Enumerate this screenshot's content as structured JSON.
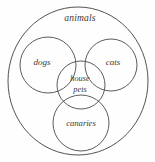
{
  "diagram": {
    "type": "euler-venn",
    "title_label": "animals",
    "background_color": "#fefefe",
    "stroke_color": "#4a4a48",
    "sets": [
      {
        "id": "animals",
        "label": "animals",
        "shape": "ellipse",
        "cx": 78,
        "cy": 81,
        "rx": 70,
        "ry": 74,
        "label_x": 80,
        "label_y": 19
      },
      {
        "id": "dogs",
        "label": "dogs",
        "shape": "circle",
        "cx": 48,
        "cy": 65,
        "r": 28,
        "label_x": 42,
        "label_y": 63
      },
      {
        "id": "cats",
        "label": "cats",
        "shape": "circle",
        "cx": 111,
        "cy": 65,
        "r": 26,
        "label_x": 113,
        "label_y": 63
      },
      {
        "id": "house-pets",
        "label_line1": "house",
        "label_line2": "pets",
        "shape": "circle",
        "cx": 81,
        "cy": 85,
        "r": 24,
        "label_x": 80,
        "label_y": 79
      },
      {
        "id": "canaries",
        "label": "canaries",
        "shape": "circle",
        "cx": 81,
        "cy": 123,
        "r": 28,
        "label_x": 81,
        "label_y": 124
      }
    ]
  }
}
